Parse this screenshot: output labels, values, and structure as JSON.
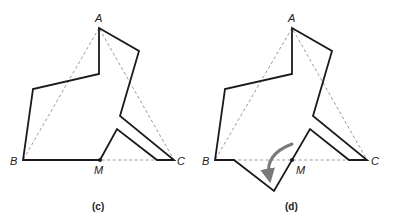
{
  "figures": [
    {
      "id": "c",
      "caption": "(c)",
      "vertices": {
        "A": "A",
        "B": "B",
        "C": "C",
        "M": "M"
      }
    },
    {
      "id": "d",
      "caption": "(d)",
      "vertices": {
        "A": "A",
        "B": "B",
        "C": "C",
        "M": "M"
      }
    }
  ],
  "colors": {
    "outline": "#1a1a1a",
    "dashed_triangle": "#9a9a9a",
    "arrow": "#7a7a7a"
  }
}
